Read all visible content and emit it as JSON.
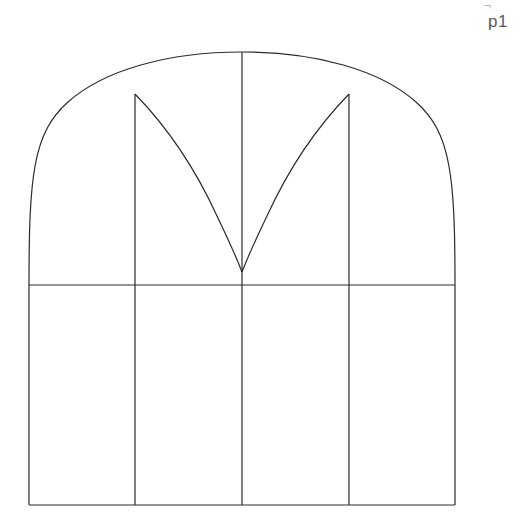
{
  "canvas": {
    "width": 520,
    "height": 530,
    "background_color": "#ffffff",
    "stroke_color": "#2b2b2b",
    "stroke_width": 1.2
  },
  "annotations": {
    "page_label": "p1",
    "page_mark": "¬",
    "page_label_color": "#5a5a5a"
  },
  "drawing": {
    "title": "Arched window with tracery",
    "type": "line-drawing",
    "geometry": {
      "left_edge_x": 29,
      "right_edge_x": 455,
      "springing_y": 285,
      "base_y": 505,
      "apex_x": 242,
      "apex_y": 52,
      "mullion_xs": [
        135,
        242,
        349
      ],
      "tracery_spring_y": 94,
      "tracery_meet_x": 242,
      "tracery_meet_y": 272
    },
    "elements": [
      {
        "name": "outer-arch",
        "kind": "curve",
        "description": "segmental arch from left springing through apex to right springing"
      },
      {
        "name": "springing-line",
        "kind": "line",
        "description": "horizontal line at arch base"
      },
      {
        "name": "left-jamb",
        "kind": "line",
        "description": "left vertical edge of lower rectangle"
      },
      {
        "name": "right-jamb",
        "kind": "line",
        "description": "right vertical edge of lower rectangle"
      },
      {
        "name": "sill-line",
        "kind": "line",
        "description": "bottom horizontal edge"
      },
      {
        "name": "mullion-left",
        "kind": "line",
        "description": "left mullion from arch to sill"
      },
      {
        "name": "mullion-center",
        "kind": "line",
        "description": "center mullion from apex to sill"
      },
      {
        "name": "mullion-right",
        "kind": "line",
        "description": "right mullion from arch to sill"
      },
      {
        "name": "tracery-left-curve",
        "kind": "curve",
        "description": "left tracery arc descending to center point"
      },
      {
        "name": "tracery-right-curve",
        "kind": "curve",
        "description": "right tracery arc descending to center point"
      }
    ],
    "paths": {
      "outer_arch": "M 29 285 C 29 176 33 133 68 102 C 104 70 168 52 242 52 C 316 52 380 70 416 102 C 451 133 455 176 455 285",
      "springing_line": "M 29 285 L 455 285",
      "left_jamb": "M 29 285 L 29 505",
      "right_jamb": "M 455 285 L 455 505",
      "sill_line": "M 29 505 L 455 505",
      "mullion_left": "M 135 94 L 135 505",
      "mullion_center": "M 242 52 L 242 505",
      "mullion_right": "M 349 94 L 349 505",
      "tracery_left": "M 135 94 C 168 128 196 170 217 216 C 229 241 237 259 242 272",
      "tracery_right": "M 349 94 C 316 128 288 170 267 216 C 255 241 247 259 242 272"
    }
  }
}
